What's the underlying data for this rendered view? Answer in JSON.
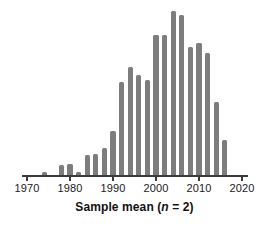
{
  "chart_data": {
    "type": "bar",
    "title": "",
    "subtitle": "",
    "xlabel_parts": {
      "lead": "Sample mean (",
      "variable": "n",
      "trail": " = 2)"
    },
    "xlabel": "Sample mean (n = 2)",
    "ylabel": "",
    "xlim": [
      1968,
      2022
    ],
    "ylim": [
      0,
      164
    ],
    "grid": false,
    "legend": null,
    "bar_color": "#7d7d7d",
    "axis_color": "#3b3b3b",
    "background_color": "#ffffff",
    "xticks": [
      1970,
      1980,
      1990,
      2000,
      2010,
      2020
    ],
    "xtick_labels": [
      "1970",
      "1980",
      "1990",
      "2000",
      "2010",
      "2020"
    ],
    "yticks": [],
    "yaxis_visible": false,
    "bin_width_years": 2,
    "categories": [
      1974,
      1978,
      1980,
      1982,
      1984,
      1986,
      1988,
      1990,
      1992,
      1994,
      1996,
      1998,
      2000,
      2002,
      2004,
      2006,
      2008,
      2010,
      2012,
      2014,
      2016
    ],
    "values": [
      3,
      10,
      11,
      3,
      20,
      21,
      27,
      44,
      93,
      108,
      100,
      95,
      140,
      140,
      164,
      160,
      128,
      132,
      122,
      73,
      35
    ]
  }
}
